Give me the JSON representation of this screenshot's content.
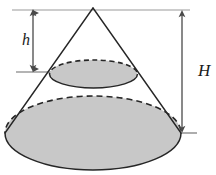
{
  "figure": {
    "labels": {
      "small_height": "h",
      "large_height": "H"
    },
    "colors": {
      "fill": "#c8c8c8",
      "outline": "#1a1a1a",
      "guide_line": "#8c8c8c",
      "dimension_line": "#4a4a4a",
      "background": "#ffffff",
      "label_text": "#1a1a1a"
    },
    "geometry": {
      "apex": {
        "x": 93,
        "y": 8
      },
      "small_ellipse": {
        "cx": 93.5,
        "cy": 74,
        "rx": 44,
        "ry": 14
      },
      "large_ellipse": {
        "cx": 93,
        "cy": 133,
        "rx": 88,
        "ry": 37
      },
      "top_guide_line": {
        "x1": 12,
        "y1": 10,
        "x2": 190,
        "y2": 10
      },
      "bottom_guide_line": {
        "x1": 168,
        "y1": 133,
        "x2": 196,
        "y2": 133
      },
      "h_tick_line": {
        "x1": 16,
        "y1": 72,
        "x2": 52,
        "y2": 72
      },
      "h_arrow": {
        "x": 33,
        "y_top": 10,
        "y_bottom": 72
      },
      "H_arrow": {
        "x": 182,
        "y_top": 10,
        "y_bottom": 133
      }
    },
    "label_positions": {
      "small_height": {
        "x": 22,
        "y": 45
      },
      "large_height": {
        "x": 199,
        "y": 75
      }
    }
  }
}
